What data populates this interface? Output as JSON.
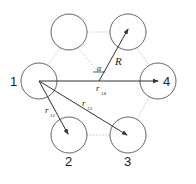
{
  "diagram": {
    "circles": [
      {
        "id": "top-left",
        "cx": 69,
        "cy": 32,
        "r": 18,
        "label": ""
      },
      {
        "id": "top-right",
        "cx": 128,
        "cy": 32,
        "r": 18,
        "label": ""
      },
      {
        "id": "1",
        "cx": 39,
        "cy": 81,
        "r": 18,
        "label": "1"
      },
      {
        "id": "4",
        "cx": 158,
        "cy": 81,
        "r": 18,
        "label": "4"
      },
      {
        "id": "2",
        "cx": 69,
        "cy": 135,
        "r": 18,
        "label": "2"
      },
      {
        "id": "3",
        "cx": 128,
        "cy": 135,
        "r": 18,
        "label": "3"
      }
    ],
    "vectors": [
      {
        "name": "r14",
        "label": "r",
        "subscript": "14"
      },
      {
        "name": "r12",
        "label": "r",
        "subscript": "12"
      },
      {
        "name": "r13",
        "label": "r",
        "subscript": "13"
      },
      {
        "name": "R",
        "label": "R"
      }
    ],
    "angle_label": "α",
    "colors": {
      "stroke": "#444444",
      "dotted": "#bbbbbb",
      "text": "#222222"
    }
  }
}
